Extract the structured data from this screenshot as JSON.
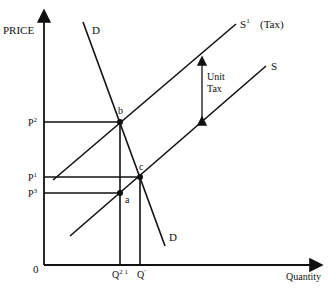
{
  "diagram": {
    "axes": {
      "y_label": "PRICE",
      "x_label": "Quantity",
      "origin_label": "0"
    },
    "curves": {
      "demand_top_label": "D",
      "demand_bottom_label": "D",
      "supply_tax_label": "S",
      "supply_tax_sup": "1",
      "supply_tax_note": "(Tax)",
      "supply_label": "S"
    },
    "annotation": {
      "line1": "Unit",
      "line2": "Tax"
    },
    "points": {
      "b": "b",
      "c": "c",
      "a": "a"
    },
    "price_levels": {
      "p2": {
        "base": "P",
        "sup": "2"
      },
      "p1": {
        "base": "P",
        "sup": "1"
      },
      "p3": {
        "base": "P",
        "sup": "3"
      }
    },
    "quantity_levels": {
      "q2": {
        "base": "Q",
        "sup": "2 1"
      },
      "q1": {
        "base": "Q",
        "sup": "'"
      }
    }
  }
}
